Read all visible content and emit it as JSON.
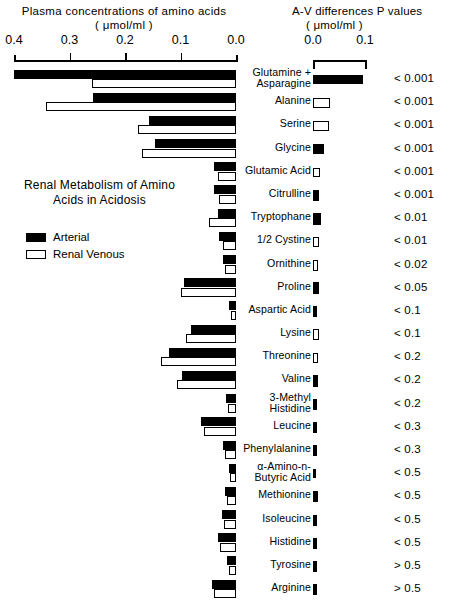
{
  "headers": {
    "left_title": "Plasma concentrations of amino acids",
    "left_units": "( μmol/ml )",
    "right_title": "A-V differences  P values",
    "right_units": "( μmol/ml )"
  },
  "caption": {
    "line1": "Renal Metabolism of Amino",
    "line2": "Acids in Acidosis"
  },
  "legend": {
    "arterial": "Arterial",
    "venous": "Renal Venous"
  },
  "axis_left": {
    "labels": [
      "0.4",
      "0.3",
      "0.2",
      "0.1",
      "0.0"
    ],
    "values": [
      0.4,
      0.3,
      0.2,
      0.1,
      0.0
    ]
  },
  "axis_right": {
    "labels": [
      "0.0",
      "0.1"
    ],
    "values": [
      0.0,
      0.1
    ]
  },
  "chart_data": {
    "type": "bar",
    "title": "Renal Metabolism of Amino Acids in Acidosis",
    "orientation": "horizontal",
    "panels": [
      {
        "name": "plasma_concentrations",
        "title": "Plasma concentrations of amino acids",
        "xlabel": "( μmol/ml )",
        "xlim": [
          0.4,
          0.0
        ],
        "reversed": true,
        "ticks": [
          0.4,
          0.3,
          0.2,
          0.1,
          0.0
        ],
        "grid": false,
        "series": [
          {
            "name": "Arterial",
            "color": "#000000"
          },
          {
            "name": "Renal Venous",
            "color": "#ffffff"
          }
        ]
      },
      {
        "name": "av_differences",
        "title": "A-V differences",
        "xlabel": "( μmol/ml )",
        "xlim": [
          0.0,
          0.115
        ],
        "ticks": [
          0.0,
          0.1
        ],
        "grid": false
      }
    ],
    "categories": [
      "Glutamine + Asparagine",
      "Alanine",
      "Serine",
      "Glycine",
      "Glutamic Acid",
      "Citrulline",
      "Tryptophane",
      "1/2 Cystine",
      "Ornithine",
      "Proline",
      "Aspartic Acid",
      "Lysine",
      "Threonine",
      "Valine",
      "3-Methyl Histidine",
      "Leucine",
      "Phenylalanine",
      "α-Amino-n-Butyric Acid",
      "Methionine",
      "Isoleucine",
      "Histidine",
      "Tyrosine",
      "Arginine"
    ],
    "arterial": [
      0.4,
      0.258,
      0.157,
      0.146,
      0.039,
      0.04,
      0.032,
      0.03,
      0.024,
      0.093,
      0.013,
      0.082,
      0.12,
      0.097,
      0.018,
      0.063,
      0.023,
      0.012,
      0.02,
      0.026,
      0.032,
      0.017,
      0.043
    ],
    "venous": [
      0.259,
      0.343,
      0.176,
      0.17,
      0.032,
      0.03,
      0.048,
      0.024,
      0.02,
      0.1,
      0.009,
      0.09,
      0.135,
      0.106,
      0.014,
      0.057,
      0.02,
      0.01,
      0.017,
      0.022,
      0.028,
      0.013,
      0.04
    ],
    "av_difference": [
      0.094,
      0.031,
      0.022,
      0.01,
      0.005,
      0.004,
      0.005,
      0.005,
      0.005,
      0.006,
      0.003,
      0.005,
      0.005,
      0.004,
      0.003,
      0.003,
      0.003,
      0.002,
      0.004,
      0.003,
      0.003,
      0.003,
      0.003
    ],
    "av_direction": [
      "uptake",
      "release",
      "release",
      "uptake",
      "release",
      "uptake",
      "uptake",
      "release",
      "release",
      "uptake",
      "uptake",
      "release",
      "release",
      "uptake",
      "uptake",
      "uptake",
      "uptake",
      "uptake",
      "uptake",
      "uptake",
      "uptake",
      "uptake",
      "uptake"
    ],
    "p_values": [
      "< 0.001",
      "< 0.001",
      "< 0.001",
      "< 0.001",
      "< 0.001",
      "< 0.001",
      "< 0.01",
      "< 0.01",
      "< 0.02",
      "< 0.05",
      "< 0.1",
      "< 0.1",
      "< 0.2",
      "< 0.2",
      "< 0.2",
      "< 0.3",
      "< 0.3",
      "< 0.5",
      "< 0.5",
      "< 0.5",
      "< 0.5",
      "> 0.5",
      "> 0.5"
    ]
  },
  "rows": [
    {
      "label1": "Glutamine +",
      "label2": "Asparagine",
      "arterial": 0.4,
      "venous": 0.259,
      "av_w": 50.0,
      "av_h": 9.0,
      "av_fill": true,
      "p": "< 0.001"
    },
    {
      "label1": "Alanine",
      "label2": "",
      "arterial": 0.258,
      "venous": 0.343,
      "av_w": 17.0,
      "av_h": 9.5,
      "av_fill": false,
      "p": "< 0.001"
    },
    {
      "label1": "Serine",
      "label2": "",
      "arterial": 0.157,
      "venous": 0.176,
      "av_w": 16.0,
      "av_h": 9.5,
      "av_fill": false,
      "p": "< 0.001"
    },
    {
      "label1": "Glycine",
      "label2": "",
      "arterial": 0.146,
      "venous": 0.17,
      "av_w": 11.0,
      "av_h": 9.5,
      "av_fill": true,
      "p": "< 0.001"
    },
    {
      "label1": "Glutamic Acid",
      "label2": "",
      "arterial": 0.039,
      "venous": 0.032,
      "av_w": 7.0,
      "av_h": 9.5,
      "av_fill": false,
      "p": "< 0.001"
    },
    {
      "label1": "Citrulline",
      "label2": "",
      "arterial": 0.04,
      "venous": 0.03,
      "av_w": 6.0,
      "av_h": 11.0,
      "av_fill": true,
      "p": "< 0.001"
    },
    {
      "label1": "Tryptophane",
      "label2": "",
      "arterial": 0.032,
      "venous": 0.048,
      "av_w": 8.0,
      "av_h": 12.0,
      "av_fill": true,
      "p": "< 0.01"
    },
    {
      "label1": "1/2 Cystine",
      "label2": "",
      "arterial": 0.03,
      "venous": 0.024,
      "av_w": 6.0,
      "av_h": 10.5,
      "av_fill": false,
      "p": "< 0.01"
    },
    {
      "label1": "Ornithine",
      "label2": "",
      "arterial": 0.024,
      "venous": 0.02,
      "av_w": 5.0,
      "av_h": 11.0,
      "av_fill": false,
      "p": "< 0.02"
    },
    {
      "label1": "Proline",
      "label2": "",
      "arterial": 0.093,
      "venous": 0.1,
      "av_w": 6.0,
      "av_h": 12.0,
      "av_fill": true,
      "p": "< 0.05"
    },
    {
      "label1": "Aspartic Acid",
      "label2": "",
      "arterial": 0.013,
      "venous": 0.009,
      "av_w": 3.5,
      "av_h": 11.0,
      "av_fill": true,
      "p": "< 0.1"
    },
    {
      "label1": "Lysine",
      "label2": "",
      "arterial": 0.082,
      "venous": 0.09,
      "av_w": 5.5,
      "av_h": 10.5,
      "av_fill": false,
      "p": "< 0.1"
    },
    {
      "label1": "Threonine",
      "label2": "",
      "arterial": 0.12,
      "venous": 0.135,
      "av_w": 5.0,
      "av_h": 10.0,
      "av_fill": false,
      "p": "< 0.2"
    },
    {
      "label1": "Valine",
      "label2": "",
      "arterial": 0.097,
      "venous": 0.106,
      "av_w": 5.0,
      "av_h": 11.5,
      "av_fill": true,
      "p": "< 0.2"
    },
    {
      "label1": "3-Methyl",
      "label2": "Histidine",
      "arterial": 0.018,
      "venous": 0.014,
      "av_w": 3.5,
      "av_h": 11.0,
      "av_fill": true,
      "p": "< 0.2"
    },
    {
      "label1": "Leucine",
      "label2": "",
      "arterial": 0.063,
      "venous": 0.057,
      "av_w": 3.5,
      "av_h": 11.0,
      "av_fill": true,
      "p": "< 0.3"
    },
    {
      "label1": "Phenylalanine",
      "label2": "",
      "arterial": 0.023,
      "venous": 0.02,
      "av_w": 4.0,
      "av_h": 11.0,
      "av_fill": true,
      "p": "< 0.3"
    },
    {
      "label1": "α-Amino-n-",
      "label2": "Butyric Acid",
      "arterial": 0.012,
      "venous": 0.01,
      "av_w": 2.5,
      "av_h": 9.0,
      "av_fill": true,
      "p": "< 0.5"
    },
    {
      "label1": "Methionine",
      "label2": "",
      "arterial": 0.02,
      "venous": 0.017,
      "av_w": 4.5,
      "av_h": 11.0,
      "av_fill": true,
      "p": "< 0.5"
    },
    {
      "label1": "Isoleucine",
      "label2": "",
      "arterial": 0.026,
      "venous": 0.022,
      "av_w": 4.0,
      "av_h": 11.0,
      "av_fill": true,
      "p": "< 0.5"
    },
    {
      "label1": "Histidine",
      "label2": "",
      "arterial": 0.032,
      "venous": 0.028,
      "av_w": 4.0,
      "av_h": 11.5,
      "av_fill": true,
      "p": "< 0.5"
    },
    {
      "label1": "Tyrosine",
      "label2": "",
      "arterial": 0.017,
      "venous": 0.013,
      "av_w": 4.0,
      "av_h": 11.0,
      "av_fill": true,
      "p": "> 0.5"
    },
    {
      "label1": "Arginine",
      "label2": "",
      "arterial": 0.043,
      "venous": 0.04,
      "av_w": 4.0,
      "av_h": 11.0,
      "av_fill": true,
      "p": "> 0.5"
    }
  ]
}
